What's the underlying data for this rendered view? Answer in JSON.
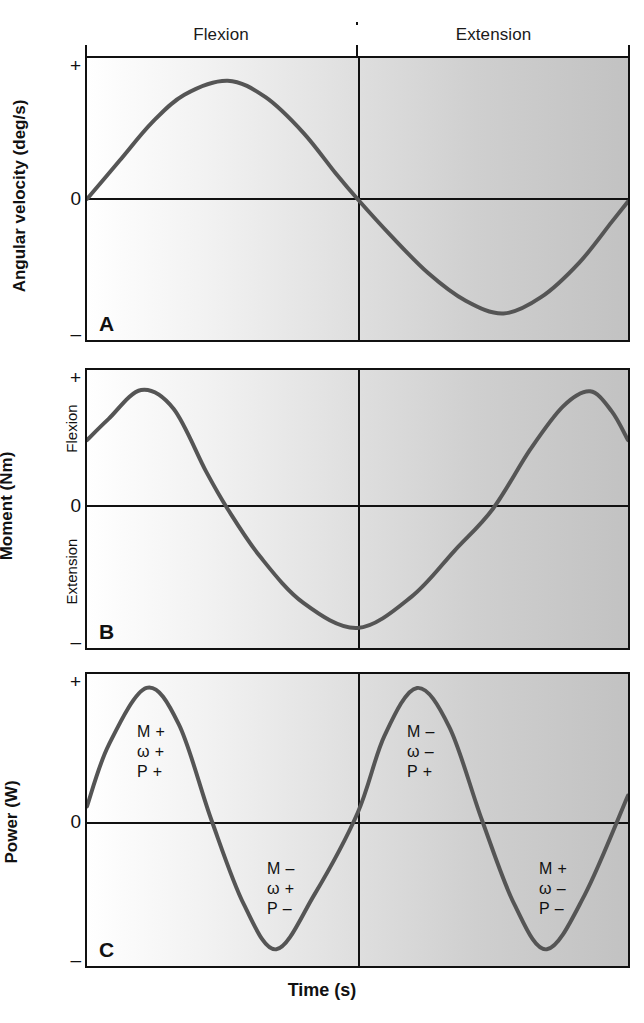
{
  "figure": {
    "xlabel": "Time (s)",
    "phases": [
      {
        "label": "Flexion"
      },
      {
        "label": "Extension"
      }
    ],
    "panels": [
      {
        "letter": "A",
        "ylabel": "Angular velocity (deg/s)",
        "ticks": {
          "top": "+",
          "zero": "0",
          "bottom": "–"
        },
        "inner_labels": []
      },
      {
        "letter": "B",
        "ylabel": "Moment (Nm)",
        "ticks": {
          "top": "+",
          "zero": "0",
          "bottom": "–"
        },
        "inner_labels": [
          {
            "text": "Flexion"
          },
          {
            "text": "Extension"
          }
        ]
      },
      {
        "letter": "C",
        "ylabel": "Power (W)",
        "ticks": {
          "top": "+",
          "zero": "0",
          "bottom": "–"
        },
        "inner_labels": []
      }
    ],
    "annotations": [
      {
        "l1": "M +",
        "l2": "ω +",
        "l3": "P +"
      },
      {
        "l1": "M –",
        "l2": "ω +",
        "l3": "P –"
      },
      {
        "l1": "M –",
        "l2": "ω –",
        "l3": "P +"
      },
      {
        "l1": "M +",
        "l2": "ω –",
        "l3": "P –"
      }
    ]
  },
  "colors": {
    "curve": "#555555",
    "axis": "#111111",
    "bg_left": "#ffffff",
    "bg_right": "#c2c2c2"
  },
  "chart_data": {
    "type": "line",
    "title": "",
    "xlabel": "Time (s)",
    "x_range": [
      0,
      1
    ],
    "grid": false,
    "legend": "none",
    "phase_divider_x": 0.5,
    "panels": [
      {
        "id": "A",
        "ylabel": "Angular velocity (deg/s)",
        "ytick_labels": [
          "+",
          "0",
          "–"
        ],
        "ylim": [
          -1,
          1
        ],
        "zero_fraction_from_top": 0.5,
        "x": [
          0.0,
          0.06,
          0.12,
          0.18,
          0.26,
          0.33,
          0.4,
          0.46,
          0.5,
          0.56,
          0.63,
          0.7,
          0.77,
          0.84,
          0.91,
          0.97,
          1.0
        ],
        "y": [
          0.0,
          0.3,
          0.6,
          0.82,
          0.93,
          0.8,
          0.52,
          0.2,
          0.0,
          -0.28,
          -0.58,
          -0.8,
          -0.9,
          -0.77,
          -0.5,
          -0.18,
          -0.02
        ]
      },
      {
        "id": "B",
        "ylabel": "Moment (Nm)",
        "ytick_labels": [
          "+",
          "0",
          "–"
        ],
        "inner_positive_label": "Flexion",
        "inner_negative_label": "Extension",
        "ylim": [
          -1,
          1
        ],
        "zero_fraction_from_top": 0.5,
        "x": [
          0.0,
          0.04,
          0.1,
          0.16,
          0.22,
          0.26,
          0.32,
          0.4,
          0.5,
          0.6,
          0.68,
          0.75,
          0.82,
          0.88,
          0.93,
          0.97,
          1.0
        ],
        "y": [
          0.55,
          0.72,
          0.95,
          0.8,
          0.3,
          0.0,
          -0.38,
          -0.75,
          -0.95,
          -0.7,
          -0.33,
          0.0,
          0.48,
          0.82,
          0.94,
          0.78,
          0.55
        ]
      },
      {
        "id": "C",
        "ylabel": "Power (W)",
        "ytick_labels": [
          "+",
          "0",
          "–"
        ],
        "ylim": [
          -1,
          1
        ],
        "zero_fraction_from_top": 0.5,
        "x": [
          0.0,
          0.04,
          0.11,
          0.17,
          0.23,
          0.29,
          0.35,
          0.42,
          0.5,
          0.55,
          0.61,
          0.67,
          0.73,
          0.79,
          0.85,
          0.92,
          1.0
        ],
        "y": [
          0.1,
          0.55,
          0.97,
          0.7,
          0.0,
          -0.62,
          -0.95,
          -0.55,
          0.05,
          0.62,
          0.97,
          0.68,
          0.0,
          -0.62,
          -0.95,
          -0.55,
          0.18
        ],
        "annotations": [
          {
            "text": "M +\nω +\nP +",
            "x": 0.13,
            "y": 0.45
          },
          {
            "text": "M –\nω +\nP –",
            "x": 0.4,
            "y": -0.48
          },
          {
            "text": "M –\nω –\nP +",
            "x": 0.62,
            "y": 0.45
          },
          {
            "text": "M +\nω –\nP –",
            "x": 0.88,
            "y": -0.48
          }
        ]
      }
    ]
  }
}
